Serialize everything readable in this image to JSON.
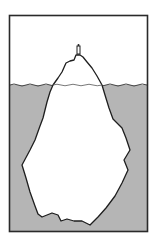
{
  "diagram": {
    "type": "illustration",
    "regions": [
      {
        "name": "above-water",
        "label": "Visible tip"
      },
      {
        "name": "below-water",
        "label": "Hidden mass"
      }
    ],
    "colors": {
      "background": "#ffffff",
      "sky": "#ffffff",
      "water": "#b5b5b5",
      "ice": "#ffffff",
      "outline": "#222222",
      "frame": "#333333"
    },
    "frame": {
      "x": 9,
      "y": 15,
      "width": 139,
      "height": 217
    },
    "waterline_y": 85
  }
}
